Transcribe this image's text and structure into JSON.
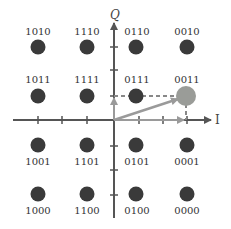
{
  "diagram": {
    "title": "",
    "type": "16-QAM constellation",
    "axes": {
      "x_label": "I",
      "y_label": "Q"
    },
    "colors": {
      "point": "#3a3a3a",
      "axis": "#555555",
      "highlight": "#9a9c98",
      "vector": "#9a9a9a"
    },
    "points": [
      {
        "label": "1010",
        "i": -3,
        "q": 3
      },
      {
        "label": "1110",
        "i": -1,
        "q": 3
      },
      {
        "label": "0110",
        "i": 1,
        "q": 3
      },
      {
        "label": "0010",
        "i": 3,
        "q": 3
      },
      {
        "label": "1011",
        "i": -3,
        "q": 1
      },
      {
        "label": "1111",
        "i": -1,
        "q": 1
      },
      {
        "label": "0111",
        "i": 1,
        "q": 1
      },
      {
        "label": "0011",
        "i": 3,
        "q": 1,
        "highlighted": true
      },
      {
        "label": "1001",
        "i": -3,
        "q": -1
      },
      {
        "label": "1101",
        "i": -1,
        "q": -1
      },
      {
        "label": "0101",
        "i": 1,
        "q": -1
      },
      {
        "label": "0001",
        "i": 3,
        "q": -1
      },
      {
        "label": "1000",
        "i": -3,
        "q": -3
      },
      {
        "label": "1100",
        "i": -1,
        "q": -3
      },
      {
        "label": "0100",
        "i": 1,
        "q": -3
      },
      {
        "label": "0000",
        "i": 3,
        "q": -3
      }
    ],
    "highlighted_symbol": "0011"
  }
}
